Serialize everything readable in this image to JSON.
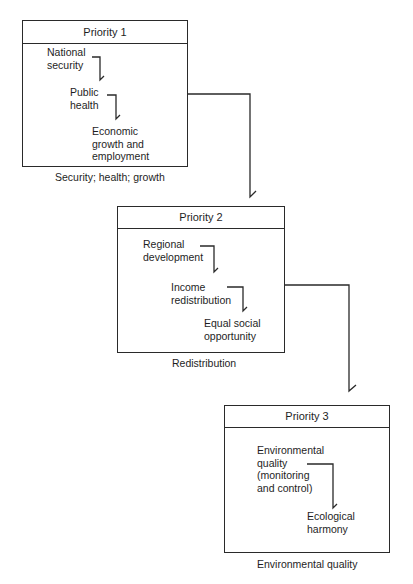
{
  "priorities": [
    {
      "title": "Priority 1",
      "items": [
        "National\nsecurity",
        "Public\nhealth",
        "Economic\ngrowth and\nemployment"
      ],
      "caption": "Security; health; growth"
    },
    {
      "title": "Priority 2",
      "items": [
        "Regional\ndevelopment",
        "Income\nredistribution",
        "Equal social\nopportunity"
      ],
      "caption": "Redistribution"
    },
    {
      "title": "Priority 3",
      "items": [
        "Environmental\nquality\n(monitoring\nand control)",
        "Ecological\nharmony"
      ],
      "caption": "Environmental quality"
    }
  ],
  "colors": {
    "line": "#2a2a2a",
    "text": "#1e1e1e",
    "background": "#ffffff"
  }
}
